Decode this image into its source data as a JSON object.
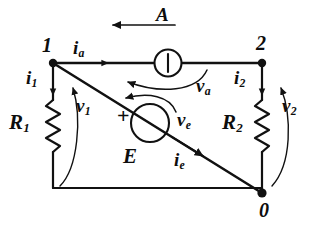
{
  "figure": {
    "kind": "electrical-circuit-schematic",
    "background_color": "#ffffff",
    "line_color": "#111111"
  },
  "nodes": [
    {
      "id": "node-1",
      "label": "1",
      "x": 53,
      "y": 63
    },
    {
      "id": "node-2",
      "label": "2",
      "x": 262,
      "y": 63
    },
    {
      "id": "node-0",
      "label": "0",
      "x": 262,
      "y": 193
    }
  ],
  "components": {
    "current_source": {
      "name": "A",
      "symbol": "circle-with-vertical-bar",
      "branch_label": "A",
      "current_label": "i",
      "current_subscript": "a",
      "voltage_label": "v",
      "voltage_subscript": "a"
    },
    "voltage_source": {
      "name": "E",
      "symbol": "circle",
      "polarity_marker": "+",
      "voltage_label": "v",
      "voltage_subscript": "e",
      "current_label": "i",
      "current_subscript": "e"
    },
    "resistor_1": {
      "name": "R",
      "subscript": "1",
      "symbol": "zigzag",
      "current_label": "i",
      "current_subscript": "1",
      "voltage_label": "v",
      "voltage_subscript": "1"
    },
    "resistor_2": {
      "name": "R",
      "subscript": "2",
      "symbol": "zigzag",
      "current_label": "i",
      "current_subscript": "2",
      "voltage_label": "v",
      "voltage_subscript": "2"
    }
  },
  "labels": {
    "node_1": "1",
    "node_2": "2",
    "node_0": "0",
    "source_a": "A",
    "source_e": "E",
    "plus_sign": "+",
    "resistor_1_base": "R",
    "resistor_1_sub": "1",
    "resistor_2_base": "R",
    "resistor_2_sub": "2",
    "i_a_base": "i",
    "i_a_sub": "a",
    "i_1_base": "i",
    "i_1_sub": "1",
    "i_2_base": "i",
    "i_2_sub": "2",
    "i_e_base": "i",
    "i_e_sub": "e",
    "v_a_base": "v",
    "v_a_sub": "a",
    "v_1_base": "v",
    "v_1_sub": "1",
    "v_2_base": "v",
    "v_2_sub": "2",
    "v_e_base": "v",
    "v_e_sub": "e"
  }
}
